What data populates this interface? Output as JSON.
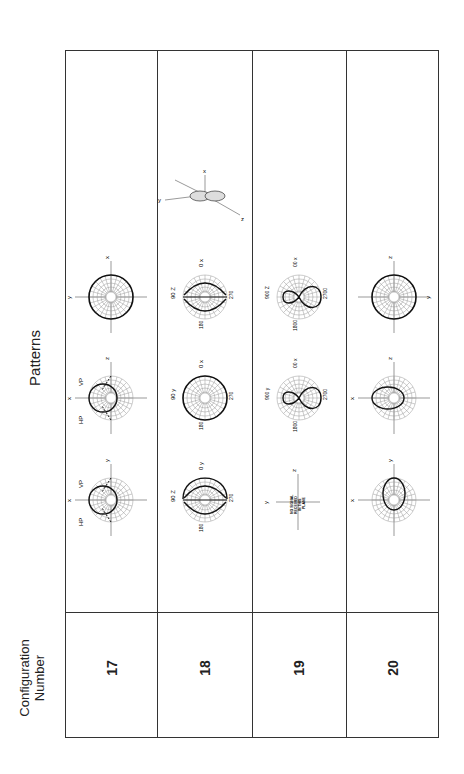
{
  "header": {
    "patterns_label": "Patterns",
    "config_label_line1": "Configuration",
    "config_label_line2": "Number"
  },
  "configurations": [
    {
      "number": "17",
      "patterns": [
        {
          "type": "circle",
          "axes": [
            "y",
            "x"
          ],
          "labels": []
        },
        {
          "type": "half-lobe",
          "axes": [
            "x",
            "z"
          ],
          "labels": [
            "HP",
            "VP"
          ]
        },
        {
          "type": "half-lobe",
          "axes": [
            "x",
            "y"
          ],
          "labels": [
            "HP",
            "VP"
          ]
        }
      ]
    },
    {
      "number": "18",
      "patterns": [
        {
          "type": "figure-eight-horizontal",
          "axes": [
            "z",
            "y"
          ],
          "labels": [
            "0",
            "90",
            "180",
            "270"
          ]
        },
        {
          "type": "circle",
          "axes": [
            "y",
            "x"
          ],
          "labels": [
            "0",
            "90",
            "180",
            "270"
          ]
        },
        {
          "type": "figure-eight-horizontal",
          "axes": [
            "z",
            "x"
          ],
          "labels": [
            "0",
            "90",
            "180",
            "270"
          ]
        },
        {
          "type": "3d-view",
          "axes": [
            "x",
            "y",
            "z"
          ]
        }
      ]
    },
    {
      "number": "19",
      "patterns": [
        {
          "type": "no-signal",
          "axes": [
            "y",
            "z"
          ],
          "note": "NO SIGNAL RECEIVED IN THIS PLANE"
        },
        {
          "type": "figure-eight-vertical",
          "axes": [
            "y",
            "x"
          ],
          "labels": [
            "00",
            "900",
            "1800",
            "2700"
          ]
        },
        {
          "type": "figure-eight-vertical",
          "axes": [
            "z",
            "x"
          ],
          "labels": [
            "00",
            "900",
            "1800",
            "2700"
          ]
        }
      ]
    },
    {
      "number": "20",
      "patterns": [
        {
          "type": "partial-lobe",
          "axes": [
            "x",
            "y"
          ],
          "labels": []
        },
        {
          "type": "partial-lobe",
          "axes": [
            "x",
            "z"
          ],
          "labels": []
        },
        {
          "type": "circle",
          "axes": [
            "z",
            "y"
          ],
          "labels": []
        }
      ]
    }
  ]
}
